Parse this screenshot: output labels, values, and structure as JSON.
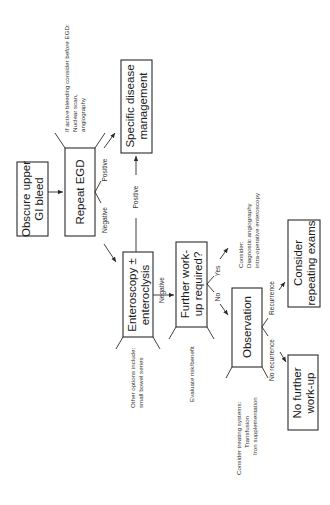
{
  "diagram": {
    "orientation": "rotated-90-ccw",
    "nodes": {
      "start": {
        "line1": "Obscure upper",
        "line2": "GI bleed"
      },
      "repeat_egd": {
        "label": "Repeat EGD"
      },
      "specific_mgmt": {
        "line1": "Specific disease",
        "line2": "management"
      },
      "enteroscopy": {
        "line1": "Enteroscopy ±",
        "line2": "enteroclysis"
      },
      "further_workup": {
        "line1": "Further work-",
        "line2": "up required?"
      },
      "observation": {
        "label": "Observation"
      },
      "consider_repeat": {
        "line1": "Consider",
        "line2": "repeating exams"
      },
      "no_further": {
        "line1": "No further",
        "line2": "work-up"
      }
    },
    "notes": {
      "active_bleeding": {
        "line1": "If active bleeding consider before EGD:",
        "line2": "Nuclear scan,",
        "line3": "angiography"
      },
      "other_options": {
        "line1": "Other options include:",
        "line2": "small bowel series"
      },
      "evaluate": {
        "line1": "Evaluate risk/benefit"
      },
      "consider_diag": {
        "line1": "Consider:",
        "line2": "Diagnostic angiography",
        "line3": "intra-operative enteroscopy"
      },
      "consider_treat": {
        "line1": "Consider treating systems:",
        "line2": "Transfusion",
        "line3": "Iron supplementation"
      }
    },
    "edges": {
      "egd_positive": "Positive",
      "egd_negative": "Negative",
      "entero_positive": "Positive",
      "entero_negative": "Negative",
      "workup_yes": "Yes",
      "workup_no": "No",
      "obs_recurrence": "Recurrence",
      "obs_no_recurrence": "No recurrence"
    }
  }
}
